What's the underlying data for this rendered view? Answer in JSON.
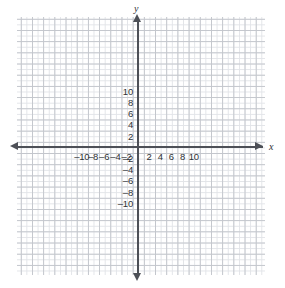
{
  "chart_data": {
    "type": "scatter",
    "title": "",
    "xlabel": "x",
    "ylabel": "y",
    "xlim": [
      -11,
      11
    ],
    "ylim": [
      -11,
      11
    ],
    "grid": true,
    "legend": false,
    "minor_gridline_step": 1,
    "major_gridline_step": 2,
    "x_ticks": [
      -10,
      -8,
      -6,
      -4,
      -2,
      2,
      4,
      6,
      8,
      10
    ],
    "y_ticks": [
      10,
      8,
      6,
      4,
      2,
      -2,
      -4,
      -6,
      -8,
      -10
    ],
    "x_tick_labels": [
      "–10",
      "–8",
      "–6",
      "–4",
      "–2",
      "2",
      "4",
      "6",
      "8",
      "10"
    ],
    "y_tick_labels": [
      "10",
      "8",
      "6",
      "4",
      "2",
      "–2",
      "–4",
      "–6",
      "–8",
      "–10"
    ],
    "series": [],
    "annotations": []
  },
  "colors": {
    "axis": "#4d5057",
    "grid_major": "#c3c6cc",
    "grid_minor": "#e2e4e8",
    "label_text": "#2f3236",
    "background": "#ffffff"
  },
  "axes": {
    "x_axis_name": "x",
    "y_axis_name": "y"
  }
}
